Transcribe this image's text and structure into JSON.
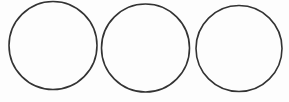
{
  "diagram": {
    "background": "#fdfdfd",
    "stroke_color": "#333333",
    "stroke_width": 1.6,
    "shapes": [
      {
        "type": "circle",
        "cx": 53,
        "cy": 45.5,
        "r": 44
      },
      {
        "type": "circle",
        "cx": 145.5,
        "cy": 48,
        "r": 44
      },
      {
        "type": "circle",
        "cx": 239,
        "cy": 48.5,
        "r": 43
      }
    ]
  }
}
